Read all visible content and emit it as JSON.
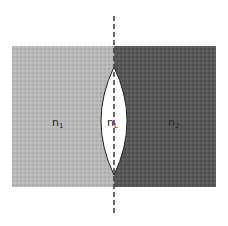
{
  "diagram": {
    "title": "",
    "regions": [
      {
        "id": "medium-1",
        "label": "n",
        "subscript": "1",
        "color": "#b6b6b6"
      },
      {
        "id": "lens",
        "label": "n",
        "subscript": "L",
        "color": "#ffffff"
      },
      {
        "id": "medium-2",
        "label": "n",
        "subscript": "2",
        "color": "#565656"
      }
    ],
    "axis": {
      "style": "dashed",
      "color": "#444444"
    },
    "lens_outline_color": "#222222"
  }
}
